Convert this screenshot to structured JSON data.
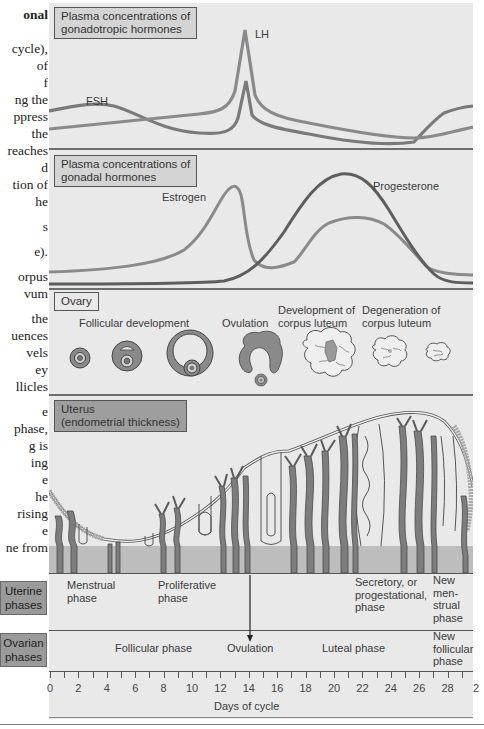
{
  "left_text": {
    "lines": [
      {
        "text": "onal",
        "bold": true,
        "top": 6
      },
      {
        "text": "cycle),",
        "top": 40
      },
      {
        "text": "of",
        "top": 57
      },
      {
        "text": "f",
        "top": 74
      },
      {
        "text": "ng the",
        "top": 91
      },
      {
        "text": "ppress",
        "top": 108
      },
      {
        "text": "the",
        "top": 125
      },
      {
        "text": "reaches",
        "top": 142
      },
      {
        "text": "d",
        "top": 159
      },
      {
        "text": "tion of",
        "top": 176
      },
      {
        "text": "he",
        "top": 193
      },
      {
        "text": "s",
        "top": 218
      },
      {
        "text": "e).",
        "top": 243
      },
      {
        "text": "orpus",
        "top": 268
      },
      {
        "text": "vum",
        "top": 285
      },
      {
        "text": "the",
        "top": 310
      },
      {
        "text": "uences",
        "top": 327
      },
      {
        "text": "vels",
        "top": 344
      },
      {
        "text": "ey",
        "top": 361
      },
      {
        "text": "llicles",
        "top": 378
      },
      {
        "text": "e",
        "top": 403
      },
      {
        "text": "phase,",
        "top": 420
      },
      {
        "text": "g is",
        "top": 437
      },
      {
        "text": "ing",
        "top": 454
      },
      {
        "text": "e",
        "top": 471
      },
      {
        "text": "he",
        "top": 488
      },
      {
        "text": "rising",
        "top": 505
      },
      {
        "text": "e",
        "top": 522
      },
      {
        "text": "ne from",
        "top": 539
      },
      {
        "text": "changes",
        "top": 556
      },
      {
        "text": "ble",
        "top": 573
      }
    ]
  },
  "panels": {
    "gonadotropic": {
      "title_line1": "Plasma concentrations of",
      "title_line2": "gonadotropic hormones",
      "series": [
        {
          "name": "FSH",
          "label": "FSH",
          "color": "#7a7a7a"
        },
        {
          "name": "LH",
          "label": "LH",
          "color": "#8a8a8a"
        }
      ]
    },
    "gonadal": {
      "title_line1": "Plasma concentrations of",
      "title_line2": "gonadal hormones",
      "series": [
        {
          "name": "Estrogen",
          "label": "Estrogen",
          "color": "#8a8a8a"
        },
        {
          "name": "Progesterone",
          "label": "Progesterone",
          "color": "#5e5e5e"
        }
      ]
    },
    "ovary": {
      "title": "Ovary",
      "stages": [
        {
          "label": "Follicular development"
        },
        {
          "label": "Ovulation"
        },
        {
          "label_line1": "Development of",
          "label_line2": "corpus luteum"
        },
        {
          "label_line1": "Degeneration of",
          "label_line2": "corpus luteum"
        }
      ]
    },
    "uterus": {
      "title_line1": "Uterus",
      "title_line2": "(endometrial thickness)"
    }
  },
  "uterine_phases": {
    "side_label_line1": "Uterine",
    "side_label_line2": "phases",
    "phases": [
      {
        "lines": [
          "Menstrual",
          "phase"
        ]
      },
      {
        "lines": [
          "Proliferative",
          "phase"
        ]
      },
      {
        "lines": [
          "Secretory, or",
          "progestational,",
          "phase"
        ]
      },
      {
        "lines": [
          "New",
          "men-",
          "strual",
          "phase"
        ]
      }
    ]
  },
  "ovarian_phases": {
    "side_label_line1": "Ovarian",
    "side_label_line2": "phases",
    "phases": [
      {
        "lines": [
          "Follicular phase"
        ]
      },
      {
        "lines": [
          "Ovulation"
        ]
      },
      {
        "lines": [
          "Luteal phase"
        ]
      },
      {
        "lines": [
          "New",
          "follicular",
          "phase"
        ]
      }
    ]
  },
  "axis": {
    "label": "Days of cycle",
    "tick_labels": [
      "0",
      "2",
      "4",
      "6",
      "8",
      "10",
      "12",
      "14",
      "16",
      "18",
      "20",
      "22",
      "24",
      "26",
      "28",
      "2"
    ],
    "min_day": 0,
    "max_day": 29,
    "ovulation_day": 14
  },
  "colors": {
    "panel_bg": "#e9e9e9",
    "label_box": "#d4d4d4",
    "side_box": "#9a9a9a",
    "tissue": "#7d7d7d",
    "basal_band": "#bdbdbd",
    "divider": "#6e6e6e"
  }
}
